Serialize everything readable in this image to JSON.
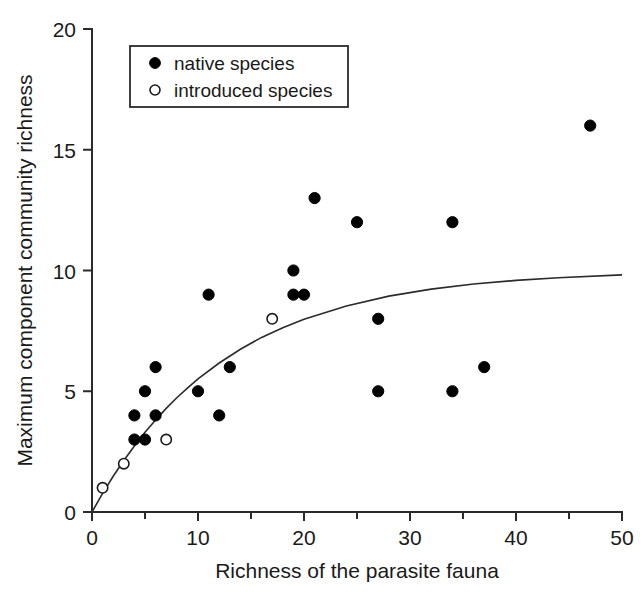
{
  "chart_data": {
    "type": "scatter",
    "title": "",
    "xlabel": "Richness of the parasite fauna",
    "ylabel": "Maximum component community richness",
    "xlim": [
      0,
      50
    ],
    "ylim": [
      0,
      20
    ],
    "xticks": [
      0,
      10,
      20,
      30,
      40,
      50
    ],
    "yticks": [
      0,
      5,
      10,
      15,
      20
    ],
    "xtick_labels": [
      "0",
      "10",
      "20",
      "30",
      "40",
      "50"
    ],
    "ytick_labels": [
      "0",
      "5",
      "10",
      "15",
      "20"
    ],
    "xminor_ticks": [
      5,
      15,
      25,
      35,
      45
    ],
    "grid": false,
    "legend_position": "top-left",
    "series": [
      {
        "name": "native species",
        "marker": "filled-circle",
        "color": "#000000",
        "points": [
          [
            4,
            4
          ],
          [
            5,
            5
          ],
          [
            6,
            6
          ],
          [
            4,
            3
          ],
          [
            5,
            3
          ],
          [
            6,
            4
          ],
          [
            10,
            5
          ],
          [
            11,
            9
          ],
          [
            12,
            4
          ],
          [
            13,
            6
          ],
          [
            19,
            10
          ],
          [
            19,
            9
          ],
          [
            20,
            9
          ],
          [
            21,
            13
          ],
          [
            25,
            12
          ],
          [
            27,
            8
          ],
          [
            27,
            5
          ],
          [
            34,
            12
          ],
          [
            34,
            5
          ],
          [
            37,
            6
          ],
          [
            47,
            16
          ]
        ]
      },
      {
        "name": "introduced species",
        "marker": "open-circle",
        "color": "#ffffff",
        "points": [
          [
            1,
            1
          ],
          [
            3,
            2
          ],
          [
            7,
            3
          ],
          [
            17,
            8
          ]
        ]
      }
    ],
    "fit_curve": {
      "description": "asymptotic saturating fit",
      "formula": "y = 10 * (1 - exp(-x/12.5))",
      "asymptote": 10,
      "points": [
        [
          0,
          0
        ],
        [
          1,
          0.77
        ],
        [
          2,
          1.48
        ],
        [
          3,
          2.13
        ],
        [
          4,
          2.73
        ],
        [
          5,
          3.3
        ],
        [
          6,
          3.81
        ],
        [
          7,
          4.29
        ],
        [
          8,
          4.73
        ],
        [
          9,
          5.13
        ],
        [
          10,
          5.51
        ],
        [
          12,
          6.17
        ],
        [
          14,
          6.74
        ],
        [
          16,
          7.23
        ],
        [
          18,
          7.63
        ],
        [
          20,
          7.98
        ],
        [
          24,
          8.53
        ],
        [
          28,
          8.94
        ],
        [
          32,
          9.23
        ],
        [
          36,
          9.44
        ],
        [
          40,
          9.59
        ],
        [
          44,
          9.7
        ],
        [
          50,
          9.82
        ]
      ]
    }
  },
  "legend": {
    "items": [
      {
        "label": "native species",
        "marker": "filled-circle"
      },
      {
        "label": "introduced species",
        "marker": "open-circle"
      }
    ]
  },
  "axes": {
    "x_title": "Richness of the parasite fauna",
    "y_title": "Maximum component community richness"
  }
}
